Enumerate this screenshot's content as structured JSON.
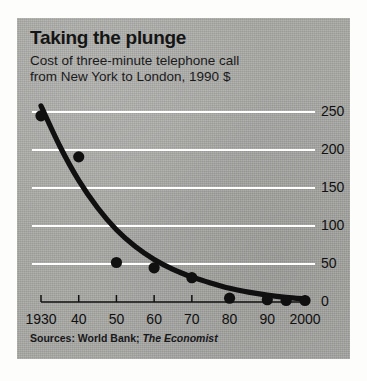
{
  "figure": {
    "title": "Taking the plunge",
    "subtitle_line1": "Cost of three-minute telephone call",
    "subtitle_line2": "from New York to London, 1990 $",
    "source_prefix": "Sources: World Bank;",
    "source_italic": "The Economist",
    "panel_color": "#a9a9a6",
    "gridline_color": "#ffffff",
    "ink_color": "#101010"
  },
  "chart_data": {
    "type": "scatter",
    "title": "Taking the plunge",
    "subtitle": "Cost of three-minute telephone call from New York to London, 1990 $",
    "xlabel": "",
    "ylabel": "",
    "xlim": [
      1930,
      2000
    ],
    "ylim": [
      0,
      250
    ],
    "grid": true,
    "legend": false,
    "x_tick_labels": [
      "1930",
      "40",
      "50",
      "60",
      "70",
      "80",
      "90",
      "2000"
    ],
    "x_ticks": [
      1930,
      1940,
      1950,
      1960,
      1970,
      1980,
      1990,
      2000
    ],
    "y_tick_labels": [
      "0",
      "50",
      "100",
      "150",
      "200",
      "250"
    ],
    "y_ticks": [
      0,
      50,
      100,
      150,
      200,
      250
    ],
    "series": [
      {
        "name": "Cost of three-minute call (1990 $)",
        "marker": "circle",
        "color": "#101010",
        "x": [
          1930,
          1940,
          1950,
          1960,
          1970,
          1980,
          1990,
          1995,
          2000
        ],
        "values": [
          245,
          191,
          52,
          45,
          32,
          5,
          3,
          2,
          2
        ]
      },
      {
        "name": "Fitted decay curve",
        "marker": "line",
        "color": "#101010",
        "x": [
          1930,
          1935,
          1940,
          1945,
          1950,
          1955,
          1960,
          1965,
          1970,
          1975,
          1980,
          1985,
          1990,
          1995,
          2000
        ],
        "values": [
          258,
          205,
          160,
          124,
          95,
          73,
          56,
          43,
          33,
          25,
          18,
          13,
          9,
          6,
          4
        ]
      }
    ]
  }
}
